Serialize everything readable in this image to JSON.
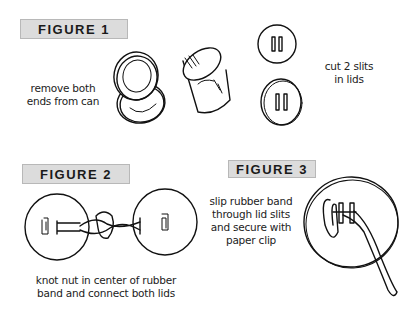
{
  "figures": [
    {
      "label": "FIGURE 1",
      "captions": [
        "remove both\nends from can",
        "cut 2 slits\nin lids"
      ]
    },
    {
      "label": "FIGURE 2",
      "caption": "knot nut in center of rubber\nband and connect both lids"
    },
    {
      "label": "FIGURE 3",
      "caption": "slip rubber band\nthrough lid slits\nand secure with\npaper clip"
    }
  ],
  "colors": {
    "label_bg": "#dcdcdc",
    "label_border": "#b8b8b8",
    "ink": "#111111"
  }
}
